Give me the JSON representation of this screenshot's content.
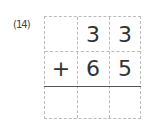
{
  "problem": {
    "number": "(14)",
    "rows": [
      {
        "cells": [
          "",
          "3",
          "3"
        ]
      },
      {
        "cells": [
          "+",
          "6",
          "5"
        ]
      },
      {
        "cells": [
          "",
          "",
          ""
        ]
      }
    ]
  }
}
